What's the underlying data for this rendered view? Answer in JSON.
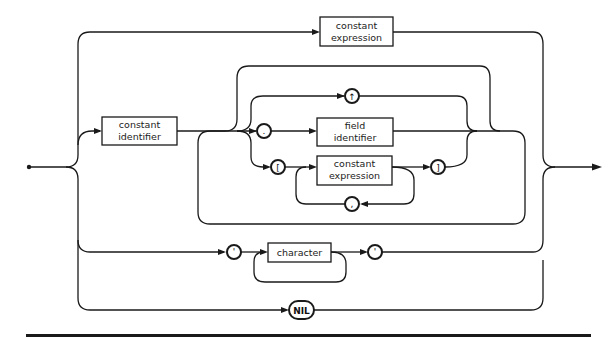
{
  "diagram": {
    "type": "syntax-diagram",
    "nonterminals": {
      "constant_expression_top": "constant\nexpression",
      "constant_identifier": "constant\nidentifier",
      "field_identifier": "field\nidentifier",
      "constant_expression_index": "constant\nexpression",
      "character": "character"
    },
    "labels": {
      "ce_top_1": "constant",
      "ce_top_2": "expression",
      "ci_1": "constant",
      "ci_2": "identifier",
      "fi_1": "field",
      "fi_2": "identifier",
      "ce_idx_1": "constant",
      "ce_idx_2": "expression",
      "character": "character"
    },
    "terminals": {
      "pointer": "↑",
      "dot": ".",
      "lbracket": "[",
      "rbracket": "]",
      "comma": ",",
      "quote_open": "'",
      "quote_close": "'",
      "nil": "NIL"
    }
  }
}
